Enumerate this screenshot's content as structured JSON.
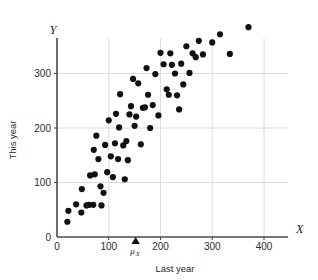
{
  "chart_data": {
    "type": "scatter",
    "title": "",
    "xlabel": "Last year",
    "ylabel": "This year",
    "x_axis_name": "X",
    "y_axis_name": "Y",
    "xlim": [
      0,
      430
    ],
    "ylim": [
      0,
      390
    ],
    "xticks": [
      0,
      100,
      200,
      300,
      400
    ],
    "yticks": [
      0,
      100,
      200,
      300
    ],
    "xtick_labels": [
      "0",
      "100",
      "200",
      "300",
      "400"
    ],
    "ytick_labels": [
      "0",
      "100",
      "200",
      "300"
    ],
    "grid": true,
    "grid_color": "#d8d8d8",
    "legend": null,
    "marker_color": "#111111",
    "marker_size": 3.1,
    "axis_color": "#4a4a4a",
    "annotations": [
      {
        "name": "mu-x-marker",
        "label": "μ",
        "subscript": "X",
        "x": 152,
        "y": 0,
        "marker": "triangle-up",
        "color": "#111111"
      }
    ],
    "points": [
      [
        20,
        28
      ],
      [
        22,
        48
      ],
      [
        37,
        60
      ],
      [
        47,
        45
      ],
      [
        48,
        88
      ],
      [
        57,
        58
      ],
      [
        62,
        59
      ],
      [
        64,
        113
      ],
      [
        70,
        59
      ],
      [
        71,
        160
      ],
      [
        73,
        115
      ],
      [
        76,
        186
      ],
      [
        80,
        143
      ],
      [
        84,
        93
      ],
      [
        86,
        58
      ],
      [
        90,
        81
      ],
      [
        93,
        169
      ],
      [
        97,
        119
      ],
      [
        100,
        214
      ],
      [
        104,
        148
      ],
      [
        108,
        110
      ],
      [
        112,
        172
      ],
      [
        114,
        226
      ],
      [
        118,
        143
      ],
      [
        120,
        201
      ],
      [
        122,
        262
      ],
      [
        128,
        168
      ],
      [
        131,
        106
      ],
      [
        134,
        176
      ],
      [
        137,
        141
      ],
      [
        140,
        225
      ],
      [
        143,
        240
      ],
      [
        147,
        290
      ],
      [
        150,
        204
      ],
      [
        153,
        221
      ],
      [
        157,
        282
      ],
      [
        162,
        170
      ],
      [
        166,
        237
      ],
      [
        170,
        238
      ],
      [
        173,
        310
      ],
      [
        176,
        261
      ],
      [
        180,
        200
      ],
      [
        185,
        242
      ],
      [
        190,
        299
      ],
      [
        196,
        223
      ],
      [
        200,
        338
      ],
      [
        206,
        317
      ],
      [
        212,
        271
      ],
      [
        216,
        261
      ],
      [
        219,
        337
      ],
      [
        222,
        316
      ],
      [
        228,
        300
      ],
      [
        232,
        260
      ],
      [
        236,
        234
      ],
      [
        240,
        318
      ],
      [
        244,
        280
      ],
      [
        250,
        350
      ],
      [
        256,
        301
      ],
      [
        262,
        337
      ],
      [
        268,
        330
      ],
      [
        274,
        360
      ],
      [
        282,
        335
      ],
      [
        300,
        357
      ],
      [
        315,
        372
      ],
      [
        334,
        336
      ],
      [
        370,
        385
      ]
    ]
  }
}
